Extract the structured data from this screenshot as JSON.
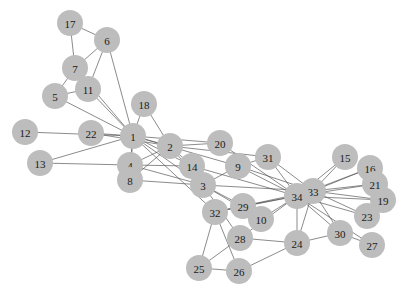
{
  "diagram": {
    "type": "network-graph",
    "node_color": "#bdbdbd",
    "edge_color": "#555555",
    "label_color": "#1a1a1a",
    "node_radius": 13,
    "nodes": [
      {
        "id": "1",
        "x": 133,
        "y": 136
      },
      {
        "id": "2",
        "x": 170,
        "y": 146
      },
      {
        "id": "3",
        "x": 203,
        "y": 185
      },
      {
        "id": "4",
        "x": 130,
        "y": 165
      },
      {
        "id": "5",
        "x": 55,
        "y": 96
      },
      {
        "id": "6",
        "x": 107,
        "y": 40
      },
      {
        "id": "7",
        "x": 75,
        "y": 68
      },
      {
        "id": "8",
        "x": 130,
        "y": 180
      },
      {
        "id": "9",
        "x": 238,
        "y": 166
      },
      {
        "id": "10",
        "x": 261,
        "y": 219
      },
      {
        "id": "11",
        "x": 88,
        "y": 89
      },
      {
        "id": "12",
        "x": 25,
        "y": 132
      },
      {
        "id": "13",
        "x": 40,
        "y": 163
      },
      {
        "id": "14",
        "x": 192,
        "y": 166
      },
      {
        "id": "15",
        "x": 345,
        "y": 157
      },
      {
        "id": "16",
        "x": 370,
        "y": 168
      },
      {
        "id": "17",
        "x": 70,
        "y": 23
      },
      {
        "id": "18",
        "x": 144,
        "y": 104
      },
      {
        "id": "19",
        "x": 383,
        "y": 200
      },
      {
        "id": "20",
        "x": 220,
        "y": 143
      },
      {
        "id": "21",
        "x": 375,
        "y": 184
      },
      {
        "id": "22",
        "x": 91,
        "y": 133
      },
      {
        "id": "23",
        "x": 367,
        "y": 216
      },
      {
        "id": "24",
        "x": 297,
        "y": 243
      },
      {
        "id": "25",
        "x": 199,
        "y": 268
      },
      {
        "id": "26",
        "x": 239,
        "y": 271
      },
      {
        "id": "27",
        "x": 372,
        "y": 245
      },
      {
        "id": "28",
        "x": 240,
        "y": 238
      },
      {
        "id": "29",
        "x": 243,
        "y": 206
      },
      {
        "id": "30",
        "x": 340,
        "y": 233
      },
      {
        "id": "31",
        "x": 268,
        "y": 157
      },
      {
        "id": "32",
        "x": 215,
        "y": 212
      },
      {
        "id": "33",
        "x": 313,
        "y": 191
      },
      {
        "id": "34",
        "x": 297,
        "y": 196
      }
    ],
    "edges": [
      [
        "1",
        "2"
      ],
      [
        "1",
        "3"
      ],
      [
        "1",
        "4"
      ],
      [
        "1",
        "5"
      ],
      [
        "1",
        "6"
      ],
      [
        "1",
        "7"
      ],
      [
        "1",
        "8"
      ],
      [
        "1",
        "9"
      ],
      [
        "1",
        "11"
      ],
      [
        "1",
        "12"
      ],
      [
        "1",
        "13"
      ],
      [
        "1",
        "14"
      ],
      [
        "1",
        "18"
      ],
      [
        "1",
        "20"
      ],
      [
        "1",
        "22"
      ],
      [
        "1",
        "32"
      ],
      [
        "2",
        "3"
      ],
      [
        "2",
        "4"
      ],
      [
        "2",
        "8"
      ],
      [
        "2",
        "14"
      ],
      [
        "2",
        "18"
      ],
      [
        "2",
        "20"
      ],
      [
        "2",
        "22"
      ],
      [
        "2",
        "31"
      ],
      [
        "3",
        "4"
      ],
      [
        "3",
        "8"
      ],
      [
        "3",
        "9"
      ],
      [
        "3",
        "10"
      ],
      [
        "3",
        "14"
      ],
      [
        "3",
        "28"
      ],
      [
        "3",
        "29"
      ],
      [
        "3",
        "33"
      ],
      [
        "4",
        "8"
      ],
      [
        "4",
        "13"
      ],
      [
        "4",
        "14"
      ],
      [
        "5",
        "7"
      ],
      [
        "5",
        "11"
      ],
      [
        "6",
        "7"
      ],
      [
        "6",
        "11"
      ],
      [
        "6",
        "17"
      ],
      [
        "7",
        "17"
      ],
      [
        "9",
        "31"
      ],
      [
        "9",
        "33"
      ],
      [
        "9",
        "34"
      ],
      [
        "10",
        "34"
      ],
      [
        "14",
        "34"
      ],
      [
        "15",
        "33"
      ],
      [
        "15",
        "34"
      ],
      [
        "16",
        "33"
      ],
      [
        "16",
        "34"
      ],
      [
        "19",
        "33"
      ],
      [
        "19",
        "34"
      ],
      [
        "20",
        "34"
      ],
      [
        "21",
        "33"
      ],
      [
        "21",
        "34"
      ],
      [
        "23",
        "33"
      ],
      [
        "23",
        "34"
      ],
      [
        "24",
        "26"
      ],
      [
        "24",
        "28"
      ],
      [
        "24",
        "30"
      ],
      [
        "24",
        "33"
      ],
      [
        "24",
        "34"
      ],
      [
        "25",
        "26"
      ],
      [
        "25",
        "28"
      ],
      [
        "25",
        "32"
      ],
      [
        "26",
        "32"
      ],
      [
        "27",
        "30"
      ],
      [
        "27",
        "34"
      ],
      [
        "28",
        "34"
      ],
      [
        "29",
        "32"
      ],
      [
        "29",
        "34"
      ],
      [
        "30",
        "33"
      ],
      [
        "30",
        "34"
      ],
      [
        "31",
        "33"
      ],
      [
        "31",
        "34"
      ],
      [
        "32",
        "33"
      ],
      [
        "32",
        "34"
      ],
      [
        "33",
        "34"
      ]
    ]
  }
}
